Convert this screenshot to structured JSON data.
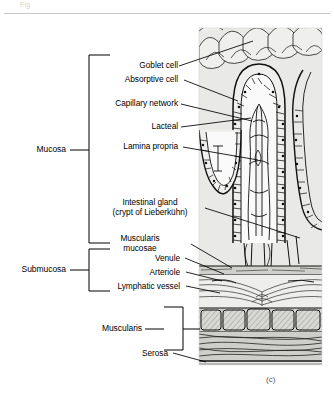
{
  "figure": {
    "header_fragment": "Fig",
    "caption": "(c)",
    "panel_bg": "#e9e9e7",
    "line_color": "#000000",
    "title_alt": "Cross section of the small intestine wall"
  },
  "labels": [
    {
      "id": "goblet-cell",
      "text": "Goblet cell"
    },
    {
      "id": "absorptive-cell",
      "text": "Absorptive cell"
    },
    {
      "id": "capillary-network",
      "text": "Capillary network"
    },
    {
      "id": "lacteal",
      "text": "Lacteal"
    },
    {
      "id": "lamina-propria",
      "text": "Lamina propria"
    },
    {
      "id": "intestinal-gland",
      "text": "Intestinal gland",
      "text2": "(crypt of Lieberkühn)"
    },
    {
      "id": "muscularis-mucosae",
      "text": "Muscularis",
      "text2": "mucosae"
    },
    {
      "id": "venule",
      "text": "Venule"
    },
    {
      "id": "arteriole",
      "text": "Arteriole"
    },
    {
      "id": "lymphatic-vessel",
      "text": "Lymphatic vessel"
    },
    {
      "id": "serosa",
      "text": "Serosa"
    }
  ],
  "groups": [
    {
      "id": "mucosa",
      "text": "Mucosa"
    },
    {
      "id": "submucosa",
      "text": "Submucosa"
    },
    {
      "id": "muscularis",
      "text": "Muscularis"
    }
  ]
}
